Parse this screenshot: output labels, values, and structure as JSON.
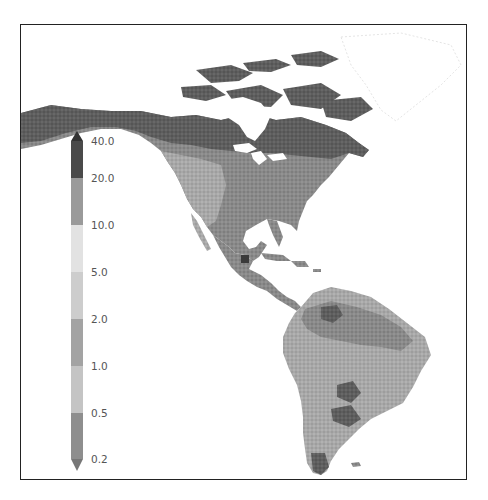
{
  "map": {
    "region": "North, Central and South America",
    "style": "grayscale raster",
    "frame_color": "#222222"
  },
  "colorbar": {
    "orientation": "vertical",
    "extend": "both",
    "ticks": [
      "40.0",
      "20.0",
      "10.0",
      "5.0",
      "2.0",
      "1.0",
      "0.5",
      "0.2"
    ],
    "segments": [
      {
        "from": "40.0",
        "to": "20.0",
        "color": "#4a4a4a"
      },
      {
        "from": "20.0",
        "to": "10.0",
        "color": "#9a9a9a"
      },
      {
        "from": "10.0",
        "to": "5.0",
        "color": "#e2e2e2"
      },
      {
        "from": "5.0",
        "to": "2.0",
        "color": "#cdcdcd"
      },
      {
        "from": "2.0",
        "to": "1.0",
        "color": "#a3a3a3"
      },
      {
        "from": "1.0",
        "to": "0.5",
        "color": "#c4c4c4"
      },
      {
        "from": "0.5",
        "to": "0.2",
        "color": "#8e8e8e"
      }
    ],
    "top_arrow_color": "#333333",
    "bottom_arrow_color": "#777777"
  },
  "caption": {
    "text": "Fig. ... (caption text cut off at bottom edge of image)"
  }
}
